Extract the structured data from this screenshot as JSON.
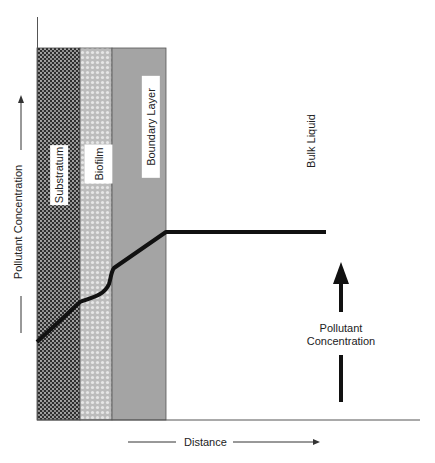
{
  "figure": {
    "regions": [
      {
        "name": "substratum",
        "label": "Substratum"
      },
      {
        "name": "biofilm",
        "label": "Biofilm"
      },
      {
        "name": "boundary-layer",
        "label": "Boundary Layer"
      },
      {
        "name": "bulk-liquid",
        "label": "Bulk Liquid"
      }
    ],
    "y_axis_label": "Pollutant Concentration",
    "x_axis_label": "Distance",
    "annotation": {
      "line1": "Pollutant",
      "line2": "Concentration"
    },
    "colors": {
      "substratum": "#3a3a3a",
      "biofilm": "#c8c8c8",
      "boundary": "#a4a4a4",
      "curve": "#111111"
    }
  }
}
